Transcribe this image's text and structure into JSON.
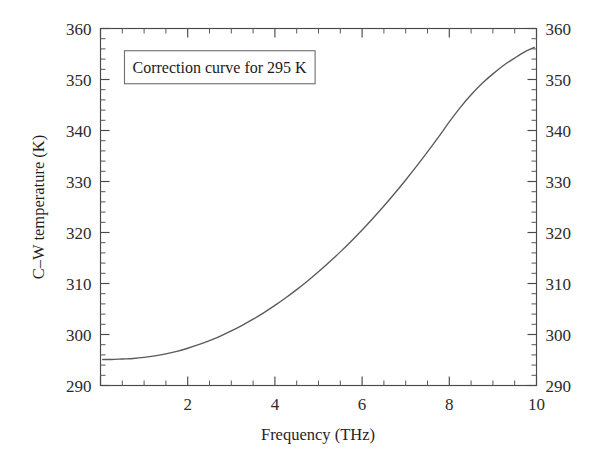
{
  "chart_data": {
    "type": "line",
    "title": "",
    "subtitle": "",
    "xlabel": "Frequency (THz)",
    "ylabel": "C–W temperature (K)",
    "xlim": [
      0,
      10
    ],
    "ylim": [
      290,
      360
    ],
    "grid": false,
    "legend_position": "none",
    "annotations": [
      {
        "name": "correction-curve-label",
        "text": "Correction curve for 295 K",
        "boxed": true,
        "x_data": 0.55,
        "y_data": 352.5
      }
    ],
    "x_ticks_major": [
      2,
      4,
      6,
      8,
      10
    ],
    "x_tick_labels": [
      "2",
      "4",
      "6",
      "8",
      "10"
    ],
    "x_minor_step": 0.5,
    "y_ticks_major": [
      290,
      300,
      310,
      320,
      330,
      340,
      350,
      360
    ],
    "y_tick_labels": [
      "290",
      "300",
      "310",
      "320",
      "330",
      "340",
      "350",
      "360"
    ],
    "y_minor_step": 2,
    "axes": {
      "left_labels": true,
      "right_labels": true,
      "top_ticks": true,
      "bottom_ticks": true
    },
    "series": [
      {
        "name": "Correction curve 295 K",
        "color": "#5a5a5a",
        "x": [
          0.05,
          0.25,
          0.5,
          0.75,
          1.0,
          1.25,
          1.5,
          1.75,
          2.0,
          2.25,
          2.5,
          2.75,
          3.0,
          3.25,
          3.5,
          3.75,
          4.0,
          4.25,
          4.5,
          4.75,
          5.0,
          5.25,
          5.5,
          5.75,
          6.0,
          6.25,
          6.5,
          6.75,
          7.0,
          7.25,
          7.5,
          7.75,
          8.0,
          8.25,
          8.5,
          8.75,
          9.0,
          9.25,
          9.5,
          9.75,
          9.95
        ],
        "y": [
          295.1,
          295.1,
          295.2,
          295.3,
          295.5,
          295.8,
          296.2,
          296.7,
          297.3,
          298.0,
          298.8,
          299.7,
          300.7,
          301.8,
          303.0,
          304.3,
          305.7,
          307.2,
          308.8,
          310.5,
          312.3,
          314.2,
          316.2,
          318.3,
          320.5,
          322.8,
          325.2,
          327.7,
          330.3,
          333.0,
          335.8,
          338.7,
          341.7,
          344.5,
          347.0,
          349.2,
          351.1,
          352.8,
          354.2,
          355.5,
          356.3
        ]
      }
    ]
  },
  "figure": {
    "background_color": "#ffffff",
    "axis_color": "#4a4a4a",
    "curve_color": "#5a5a5a"
  }
}
